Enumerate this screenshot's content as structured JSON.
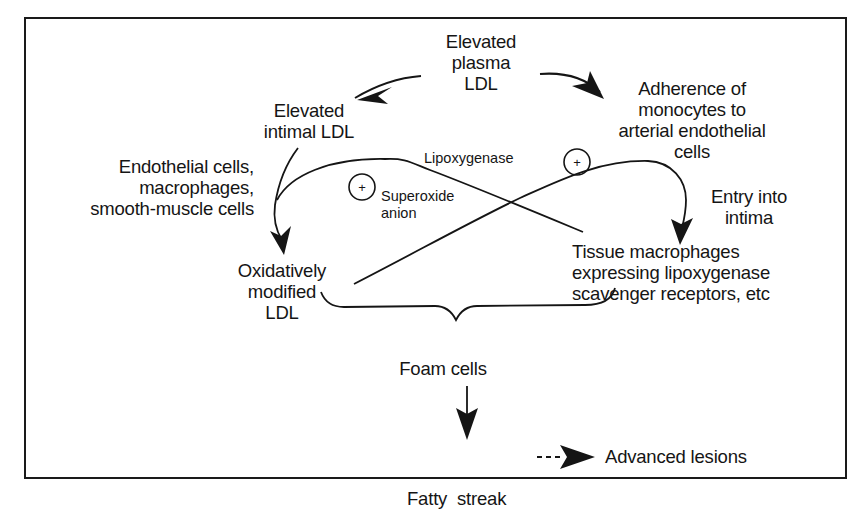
{
  "diagram": {
    "type": "flowchart",
    "nodes": {
      "plasma_ldl": {
        "lines": [
          "Elevated",
          "plasma",
          "LDL"
        ]
      },
      "intimal_ldl": {
        "lines": [
          "Elevated",
          "intimal LDL"
        ]
      },
      "adherence": {
        "lines": [
          "Adherence of",
          "monocytes to",
          "arterial endothelial",
          "cells"
        ]
      },
      "cell_types": {
        "lines": [
          "Endothelial cells,",
          "macrophages,",
          "smooth-muscle cells"
        ]
      },
      "entry": {
        "lines": [
          "Entry into",
          "intima"
        ]
      },
      "oxidized_ldl": {
        "lines": [
          "Oxidatively",
          "modified",
          "LDL"
        ]
      },
      "tissue_macrophages": {
        "lines": [
          "Tissue macrophages",
          "expressing lipoxygenase",
          "scavenger receptors, etc"
        ]
      },
      "foam_cells": {
        "label": "Foam cells"
      },
      "fatty_streak": {
        "label": "Fatty  streak"
      },
      "advanced_lesions": {
        "label": "Advanced lesions"
      }
    },
    "modifiers": {
      "lipoxygenase": {
        "label": "Lipoxygenase",
        "sign": "+"
      },
      "superoxide": {
        "lines": [
          "Superoxide",
          "anion"
        ],
        "sign": "+"
      }
    },
    "edges": [
      {
        "from": "Elevated plasma LDL",
        "to": "Elevated intimal LDL",
        "style": "solid"
      },
      {
        "from": "Elevated plasma LDL",
        "to": "Adherence of monocytes to arterial endothelial cells",
        "style": "solid"
      },
      {
        "from": "Elevated intimal LDL",
        "to": "Oxidatively modified LDL",
        "style": "solid"
      },
      {
        "from": "Tissue macrophages",
        "to": "Oxidatively modified LDL",
        "style": "solid",
        "via": "Lipoxygenase (+)"
      },
      {
        "from": "Adherence of monocytes",
        "to": "Tissue macrophages",
        "style": "solid",
        "via": "Entry into intima"
      },
      {
        "from": "Oxidatively modified LDL",
        "to": "Adherence of monocytes",
        "style": "solid",
        "via": "Superoxide anion (+)"
      },
      {
        "from": "Oxidatively modified LDL + Tissue macrophages",
        "to": "Foam cells",
        "style": "brace"
      },
      {
        "from": "Foam cells",
        "to": "Fatty streak",
        "style": "solid"
      },
      {
        "from": "Fatty streak",
        "to": "Advanced lesions",
        "style": "dashed"
      }
    ],
    "colors": {
      "ink": "#151515",
      "background": "#ffffff"
    }
  }
}
